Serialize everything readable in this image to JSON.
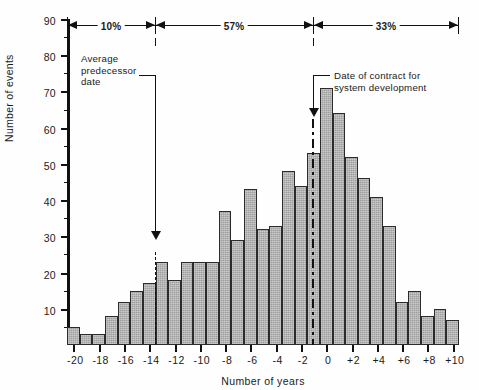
{
  "chart_data": {
    "type": "bar",
    "title": "",
    "xlabel": "Number of years",
    "ylabel": "Number of events",
    "xlim": [
      -20,
      11
    ],
    "ylim": [
      0,
      90
    ],
    "grid": false,
    "legend_position": "none",
    "x_tick_labels": [
      "-20",
      "-18",
      "-16",
      "-14",
      "-12",
      "-10",
      "-8",
      "-6",
      "-4",
      "-2",
      "0",
      "+2",
      "+4",
      "+6",
      "+8",
      "+10"
    ],
    "x_tick_values": [
      -20,
      -18,
      -16,
      -14,
      -12,
      -10,
      -8,
      -6,
      -4,
      -2,
      0,
      2,
      4,
      6,
      8,
      10
    ],
    "y_tick_labels": [
      "10",
      "20",
      "30",
      "40",
      "50",
      "60",
      "70",
      "80",
      "90"
    ],
    "y_tick_values": [
      10,
      20,
      30,
      40,
      50,
      60,
      70,
      80,
      90
    ],
    "y_minor_ticks": [
      5,
      15,
      25,
      35,
      45,
      55,
      65,
      75,
      85
    ],
    "bin_width_years": 1,
    "categories": [
      -20,
      -19,
      -18,
      -17,
      -16,
      -15,
      -14,
      -13,
      -12,
      -11,
      -10,
      -9,
      -8,
      -7,
      -6,
      -5,
      -4,
      -3,
      -2,
      -1,
      0,
      1,
      2,
      3,
      4,
      5,
      6,
      7,
      8,
      9,
      10
    ],
    "values": [
      5,
      3,
      3,
      8,
      12,
      15,
      17,
      23,
      18,
      23,
      23,
      23,
      37,
      29,
      43,
      32,
      33,
      48,
      44,
      53,
      71,
      64,
      52,
      46,
      41,
      33,
      12,
      15,
      8,
      10,
      7
    ],
    "annotations": [
      {
        "name": "average-predecessor-date",
        "label": "Average\npredecessor\ndate",
        "x": -12.6,
        "marker": "dashed-vertical-line-with-arrow"
      },
      {
        "name": "date-of-contract",
        "label": "Date of contract for\nsystem development",
        "x": 0.1,
        "marker": "dash-dot-vertical-line-with-arrow"
      }
    ],
    "percent_brackets": [
      {
        "label": "10%",
        "from": -20,
        "to": -12.6
      },
      {
        "label": "57%",
        "from": -12.6,
        "to": 0.1
      },
      {
        "label": "33%",
        "from": 0.1,
        "to": 11
      }
    ]
  },
  "axes": {
    "ylabel": "Number of events",
    "xlabel": "Number of years"
  },
  "labels": {
    "pct_left": "10%",
    "pct_mid": "57%",
    "pct_right": "33%",
    "callout_left_line1": "Average",
    "callout_left_line2": "predecessor",
    "callout_left_line3": "date",
    "callout_right_line1": "Date of contract for",
    "callout_right_line2": "system development"
  },
  "y_labels": [
    "90",
    "80",
    "70",
    "60",
    "50",
    "40",
    "30",
    "20",
    "10"
  ],
  "x_labels": [
    "-20",
    "-18",
    "-16",
    "-14",
    "-12",
    "-10",
    "-8",
    "-6",
    "-4",
    "-2",
    "0",
    "+2",
    "+4",
    "+6",
    "+8",
    "+10"
  ],
  "colors": {
    "bar_fill": "#9e9e9e",
    "bar_stroke": "#2b2b2b",
    "axis": "#111111",
    "background": "#fefefe"
  }
}
